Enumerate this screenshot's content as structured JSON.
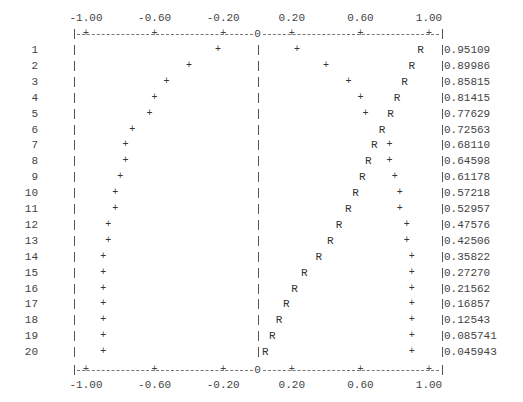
{
  "chart_data": {
    "type": "bar",
    "style": "ascii-correlogram",
    "title": "",
    "xlabel": "",
    "ylabel": "",
    "xlim": [
      -1.0,
      1.0
    ],
    "ticks": [
      "-1.00",
      "-0.60",
      "-0.20",
      "0.20",
      "0.60",
      "1.00"
    ],
    "tick_values": [
      -1.0,
      -0.6,
      -0.2,
      0.2,
      0.6,
      1.0
    ],
    "zero_marker": "0",
    "marker_value": "R",
    "marker_bound": "+",
    "lags": [
      1,
      2,
      3,
      4,
      5,
      6,
      7,
      8,
      9,
      10,
      11,
      12,
      13,
      14,
      15,
      16,
      17,
      18,
      19,
      20
    ],
    "values": [
      0.95109,
      0.89986,
      0.85815,
      0.81415,
      0.77629,
      0.72563,
      0.6811,
      0.64598,
      0.61178,
      0.57218,
      0.52957,
      0.47576,
      0.42506,
      0.35822,
      0.2727,
      0.21562,
      0.16857,
      0.12543,
      0.085741,
      0.045943
    ],
    "value_labels": [
      "0.95109",
      "0.89986",
      "0.85815",
      "0.81415",
      "0.77629",
      "0.72563",
      "0.68110",
      "0.64598",
      "0.61178",
      "0.57218",
      "0.52957",
      "0.47576",
      "0.42506",
      "0.35822",
      "0.27270",
      "0.21562",
      "0.16857",
      "0.12543",
      "0.085741",
      "0.045943"
    ],
    "confidence_bounds": [
      0.23,
      0.4,
      0.53,
      0.6,
      0.63,
      0.73,
      0.77,
      0.77,
      0.8,
      0.83,
      0.83,
      0.87,
      0.87,
      0.9,
      0.9,
      0.9,
      0.9,
      0.9,
      0.9,
      0.9
    ],
    "grid": false,
    "legend": null
  }
}
